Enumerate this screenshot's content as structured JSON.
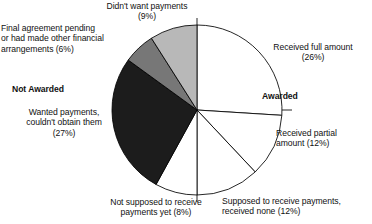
{
  "chart_data": {
    "type": "pie",
    "title": "",
    "subtitle": "",
    "xlabel": "",
    "ylabel": "",
    "legend_position": "labels-around-pie",
    "grid": false,
    "units": "percent",
    "total": 100,
    "groups": [
      {
        "name": "Awarded",
        "label": "Awarded",
        "bold": true
      },
      {
        "name": "Not Awarded",
        "label": "Not Awarded",
        "bold": true
      }
    ],
    "categories": [
      "Received full amount",
      "Received partial amount",
      "Supposed to receive payments, received none",
      "Not supposed to receive payments yet",
      "Wanted payments, couldn't obtain them",
      "Final agreement pending or had made other financial arrangements",
      "Didn't want payments"
    ],
    "values": [
      26,
      12,
      12,
      8,
      27,
      6,
      9
    ],
    "slices": [
      {
        "id": "received-full-amount",
        "label": "Received full amount",
        "value": 26,
        "value_text": "(26%)",
        "group": "Awarded",
        "color": "#ffffff",
        "start_angle": 0,
        "end_angle": 93.6
      },
      {
        "id": "received-partial-amount",
        "label": "Received partial amount",
        "value": 12,
        "value_text": "(12%)",
        "group": "Awarded",
        "color": "#ffffff",
        "start_angle": 93.6,
        "end_angle": 136.8
      },
      {
        "id": "supposed-to-receive-received-none",
        "label": "Supposed to receive payments, received none",
        "value": 12,
        "value_text": "(12%)",
        "group": "Awarded",
        "color": "#ffffff",
        "start_angle": 136.8,
        "end_angle": 180.0
      },
      {
        "id": "not-supposed-to-receive-yet",
        "label": "Not supposed to receive payments yet",
        "value": 8,
        "value_text": "(8%)",
        "group": "Awarded",
        "color": "#ffffff",
        "start_angle": 180.0,
        "end_angle": 208.8
      },
      {
        "id": "wanted-payments-couldnt-obtain",
        "label": "Wanted payments, couldn't obtain them",
        "value": 27,
        "value_text": "(27%)",
        "group": "Not Awarded",
        "color": "#1c1c1c",
        "start_angle": 208.8,
        "end_angle": 306.0
      },
      {
        "id": "final-agreement-pending",
        "label": "Final agreement pending or had made other financial arrangements",
        "value": 6,
        "value_text": "(6%)",
        "group": "Not Awarded",
        "color": "#777777",
        "start_angle": 306.0,
        "end_angle": 327.6
      },
      {
        "id": "didnt-want-payments",
        "label": "Didn't want payments",
        "value": 9,
        "value_text": "(9%)",
        "group": "Not Awarded",
        "color": "#b8b8b8",
        "start_angle": 327.6,
        "end_angle": 360.0
      }
    ]
  },
  "labels": {
    "didnt_want_payments": "Didn't want payments\n(9%)",
    "final_agreement": "Final agreement pending\nor had made other financial\narrangements (6%)",
    "not_awarded_heading": "Not Awarded",
    "wanted_payments": "Wanted payments,\ncouldn't obtain them\n(27%)",
    "received_full_amount": "Received full amount\n(26%)",
    "awarded_heading": "Awarded",
    "received_partial_amount": "Received partial\namount (12%)",
    "supposed_received_none": "Supposed to receive payments,\nreceived none (12%)",
    "not_supposed_yet": "Not supposed to receive\npayments yet (8%)"
  },
  "colors": {
    "slice_white": "#ffffff",
    "slice_dark": "#1c1c1c",
    "slice_medium_gray": "#777777",
    "slice_light_gray": "#b8b8b8",
    "outline": "#000000",
    "text": "#111111",
    "background": "#ffffff"
  }
}
